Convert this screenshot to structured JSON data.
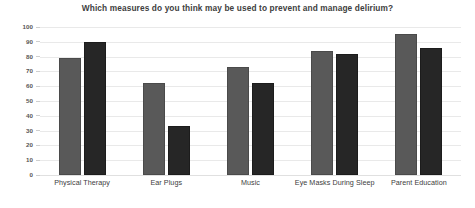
{
  "chart_data": {
    "type": "bar",
    "title": "Which measures do you think may be used to prevent and manage delirium?",
    "xlabel": "",
    "ylabel": "",
    "categories": [
      "Physical Therapy",
      "Ear Plugs",
      "Music",
      "Eye Masks During Sleep",
      "Parent Education"
    ],
    "series": [
      {
        "name": "Series 1",
        "color": "#595959",
        "values": [
          79,
          62,
          73,
          84,
          95
        ]
      },
      {
        "name": "Series 2",
        "color": "#262626",
        "values": [
          90,
          33,
          62,
          82,
          86
        ]
      }
    ],
    "ylim": [
      0,
      100
    ],
    "ytick_labels": [
      "100",
      "90",
      "80",
      "70",
      "60",
      "50",
      "40",
      "30",
      "20",
      "10",
      "0"
    ],
    "ytick_values": [
      100,
      90,
      80,
      70,
      60,
      50,
      40,
      30,
      20,
      10,
      0
    ],
    "grid": true,
    "grid_axis": "y",
    "legend": false,
    "legend_position": "none",
    "background": "#ffffff"
  }
}
